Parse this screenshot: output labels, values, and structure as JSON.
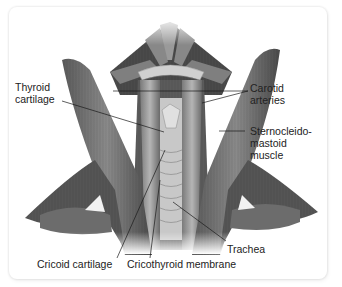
{
  "figure": {
    "labels": {
      "thyroid_cartilage": "Thyroid\ncartilage",
      "carotid_arteries": "Carotid\narteries",
      "sternocleidomastoid": "Sternocleido-\nmastoid\nmuscle",
      "trachea": "Trachea",
      "cricoid_cartilage": "Cricoid cartilage",
      "cricothyroid_membrane": "Cricothyroid membrane"
    },
    "colors": {
      "card_background": "#ffffff",
      "label_text": "#222222",
      "leader_line": "#1a1a1a",
      "muscle_dark": "#3a3a3a",
      "muscle_mid": "#6e6e6e",
      "muscle_light": "#b8b8b8",
      "cartilage": "#d8d8d8"
    }
  }
}
